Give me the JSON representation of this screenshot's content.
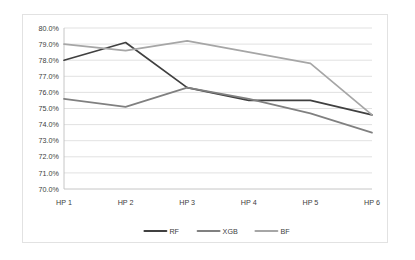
{
  "chart_data": {
    "type": "line",
    "title": "",
    "xlabel": "",
    "ylabel": "",
    "categories": [
      "HP 1",
      "HP 2",
      "HP 3",
      "HP 4",
      "HP 5",
      "HP 6"
    ],
    "ylim": [
      70.0,
      80.0
    ],
    "ytick_step": 1.0,
    "ytick_labels": [
      "80.0%",
      "79.0%",
      "78.0%",
      "77.0%",
      "76.0%",
      "75.0%",
      "74.0%",
      "73.0%",
      "72.0%",
      "71.0%",
      "70.0%"
    ],
    "ytick_values": [
      80.0,
      79.0,
      78.0,
      77.0,
      76.0,
      75.0,
      74.0,
      73.0,
      72.0,
      71.0,
      70.0
    ],
    "grid": true,
    "grid_axis": "y",
    "legend_position": "bottom",
    "value_format": "percent",
    "series": [
      {
        "name": "RF",
        "color": "#404040",
        "values": [
          78.0,
          79.1,
          76.3,
          75.5,
          75.5,
          74.6
        ]
      },
      {
        "name": "XGB",
        "color": "#808080",
        "values": [
          75.6,
          75.1,
          76.3,
          75.6,
          74.7,
          73.5
        ]
      },
      {
        "name": "BF",
        "color": "#a6a6a6",
        "values": [
          79.0,
          78.6,
          79.2,
          78.5,
          77.8,
          74.6
        ]
      }
    ]
  },
  "style": {
    "grid_color": "#d9d9d9",
    "axis_color": "#bfbfbf",
    "border_color": "#e2e2e2",
    "text_color": "#404040",
    "background": "#ffffff"
  }
}
